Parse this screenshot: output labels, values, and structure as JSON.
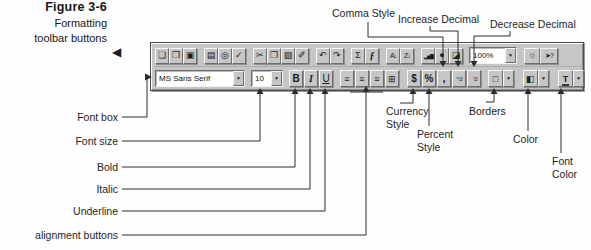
{
  "colors": {
    "toolbar_face": "#c6c6c6",
    "toolbar_highlight": "#ffffff",
    "toolbar_shadow": "#6d6d6d",
    "callout_line": "#2c2c2c",
    "text": "#1f1f1f",
    "background": "#fefefe"
  },
  "figure_caption": {
    "title": "Figure 3-6",
    "pointer": "◀",
    "line1": "Formatting",
    "line2": "toolbar buttons"
  },
  "standard_toolbar": {
    "new": "❏",
    "open": "❒",
    "save": "▣",
    "print": "▤",
    "print_preview": "◎",
    "spelling": "✓",
    "cut": "✂",
    "copy": "❐",
    "paste": "▨",
    "format_painter": "✐",
    "undo": "↶",
    "redo": "↷",
    "autosum": "Σ",
    "function_wizard": "ƒ",
    "sort_ascending": "A↓",
    "sort_descending": "Z↓",
    "chart_wizard": "▂▅▇",
    "map": "●",
    "drawing": "◪",
    "zoom_value": "100%",
    "tip_wizard": "☼",
    "help": "➤?",
    "dropdown_arrow": "▼"
  },
  "formatting_toolbar": {
    "font_name": "MS Sans Serif",
    "font_size": "10",
    "bold": "B",
    "italic": "I",
    "underline": "U",
    "align_left": "≡",
    "align_center": "≡",
    "align_right": "≡",
    "merge_center": "⊞",
    "currency": "$",
    "percent": "%",
    "comma": ",",
    "increase_decimal": "⁺.0",
    "decrease_decimal": "⁻.0",
    "borders": "□",
    "color": "◧",
    "font_color": "T",
    "dropdown_arrow": "▼"
  },
  "callouts": {
    "comma_style": "Comma Style",
    "increase_decimal": "Increase Decimal",
    "decrease_decimal": "Decrease Decimal",
    "font_box": "Font box",
    "font_size": "Font size",
    "bold": "Bold",
    "italic": "Italic",
    "underline": "Underline",
    "alignment_buttons": "alignment buttons",
    "currency_style_line1": "Currency",
    "currency_style_line2": "Style",
    "percent_style_line1": "Percent",
    "percent_style_line2": "Style",
    "borders": "Borders",
    "color": "Color",
    "font_color_line1": "Font",
    "font_color_line2": "Color"
  }
}
